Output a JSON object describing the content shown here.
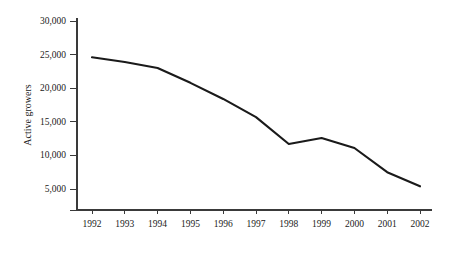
{
  "chart_data": {
    "type": "line",
    "title": "",
    "xlabel": "",
    "ylabel": "Active growers",
    "categories": [
      "1992",
      "1993",
      "1994",
      "1995",
      "1996",
      "1997",
      "1998",
      "1999",
      "2000",
      "2001",
      "2002"
    ],
    "values": [
      24600,
      23900,
      23000,
      20800,
      18400,
      15700,
      11700,
      12600,
      11100,
      7500,
      5400
    ],
    "series": [
      {
        "name": "Active growers",
        "values": [
          24600,
          23900,
          23000,
          20800,
          18400,
          15700,
          11700,
          12600,
          11100,
          7500,
          5400
        ]
      }
    ],
    "ylim": [
      0,
      30000
    ],
    "y_ticks": [
      5000,
      10000,
      15000,
      20000,
      25000,
      30000
    ],
    "y_tick_labels": [
      "5,000",
      "10,000",
      "15,000",
      "20,000",
      "25,000",
      "30,000"
    ],
    "y_axis_has_baseline_tick": true,
    "grid": false,
    "legend": false,
    "legend_position": "none",
    "line_color": "#1a1a1a",
    "axis_color": "#3a3a3a"
  }
}
